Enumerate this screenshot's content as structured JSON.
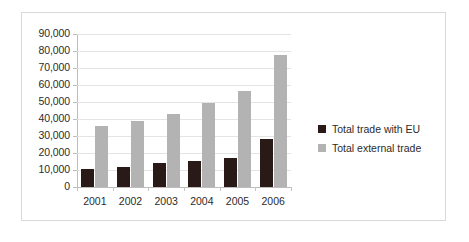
{
  "chart_data": {
    "type": "bar",
    "title": "",
    "subtitle": "",
    "xlabel": "",
    "ylabel": "",
    "grid": true,
    "legend_position": "right",
    "categories": [
      "2001",
      "2002",
      "2003",
      "2004",
      "2005",
      "2006"
    ],
    "ylim": [
      0,
      90000
    ],
    "ytick_step": 10000,
    "ytick_labels": [
      "90,000",
      "80,000",
      "70,000",
      "60,000",
      "50,000",
      "40,000",
      "30,000",
      "20,000",
      "10,000",
      "0"
    ],
    "ytick_values": [
      90000,
      80000,
      70000,
      60000,
      50000,
      40000,
      30000,
      20000,
      10000,
      0
    ],
    "series": [
      {
        "name": "Total trade with EU",
        "color": "#2a1a17",
        "values": [
          10600,
          11900,
          13900,
          15500,
          17000,
          28000
        ]
      },
      {
        "name": "Total external trade",
        "color": "#b3b3b3",
        "values": [
          35800,
          39000,
          42800,
          49700,
          56500,
          77500
        ]
      }
    ]
  },
  "legend": {
    "items": [
      {
        "label": "Total trade with EU",
        "color": "#2a1a17"
      },
      {
        "label": "Total external trade",
        "color": "#b3b3b3"
      }
    ]
  },
  "colors": {
    "series_eu": "#2a1a17",
    "series_external": "#b3b3b3",
    "gridline": "#e4e4e4",
    "axis": "#bdbdbd",
    "frame_border": "#d9d9d9",
    "text": "#2b2b2b",
    "background": "#ffffff"
  }
}
